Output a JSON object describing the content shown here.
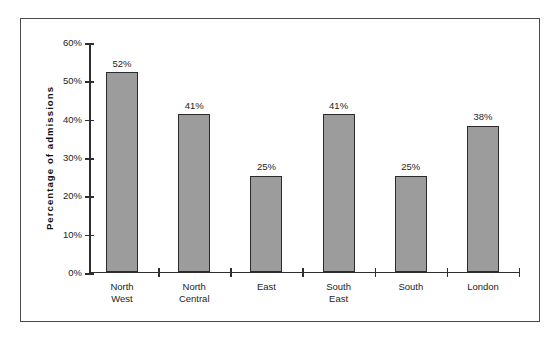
{
  "chart_data": {
    "type": "bar",
    "title": "",
    "xlabel": "",
    "ylabel": "Percentage  of  admissions",
    "categories": [
      "North West",
      "North Central",
      "East",
      "South East",
      "South",
      "London"
    ],
    "values": [
      52,
      41,
      25,
      41,
      25,
      38
    ],
    "value_labels": [
      "52%",
      "41%",
      "25%",
      "41%",
      "25%",
      "38%"
    ],
    "ylim": [
      0,
      60
    ],
    "ytick_labels": [
      "0%",
      "10%",
      "20%",
      "30%",
      "40%",
      "50%",
      "60%"
    ],
    "ytick_values": [
      0,
      10,
      20,
      30,
      40,
      50,
      60
    ],
    "grid": false,
    "legend": false,
    "bar_fill_color": "#9c9c9c",
    "bar_border_color": "#2b2b2b",
    "axis_color": "#2e2e2e",
    "frame_color": "#4a4a4a",
    "background_color": "#ffffff"
  },
  "axis": {
    "y_title": "Percentage  of  admissions"
  },
  "categories_display": [
    "North\nWest",
    "North\nCentral",
    "East",
    "South\nEast",
    "South",
    "London"
  ]
}
